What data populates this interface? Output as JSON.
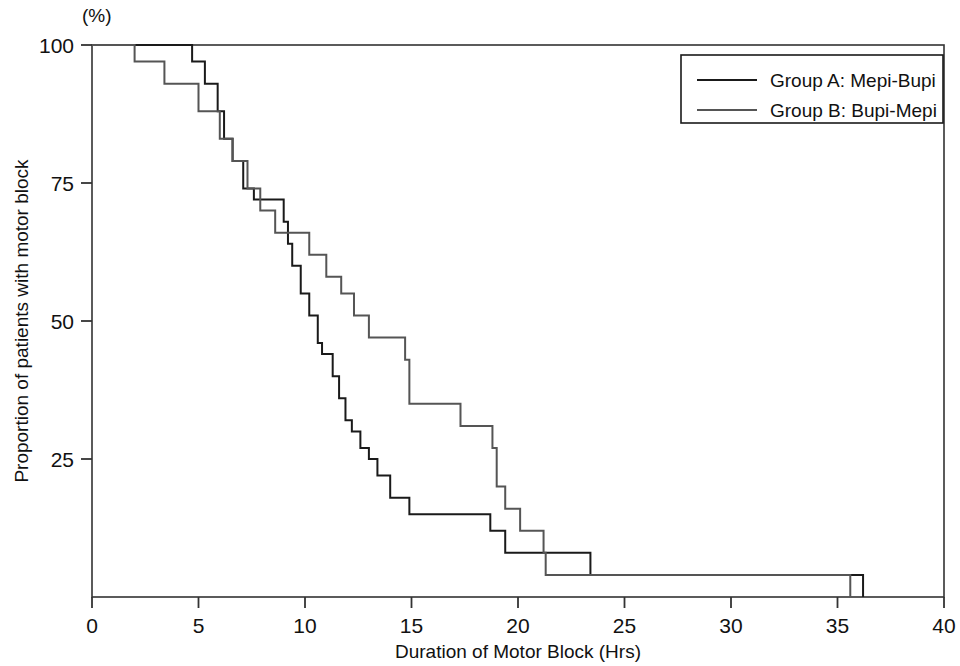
{
  "chart_data": {
    "type": "line",
    "subtype": "kaplan-meier-step",
    "title": "",
    "xlabel": "Duration of Motor Block (Hrs)",
    "ylabel": "Proportion of patients with motor block",
    "y_unit_label": "(%)",
    "xlim": [
      0,
      40
    ],
    "ylim": [
      0,
      100
    ],
    "xticks": [
      0,
      5,
      10,
      15,
      20,
      25,
      30,
      35,
      40
    ],
    "xtick_labels": [
      "0",
      "5",
      "10",
      "15",
      "20",
      "25",
      "30",
      "35",
      "40"
    ],
    "yticks": [
      25,
      50,
      75,
      100
    ],
    "ytick_labels": [
      "25",
      "50",
      "75",
      "100"
    ],
    "grid": false,
    "legend_position": "top-right",
    "legend_border": true,
    "series": [
      {
        "name": "Group A: Mepi-Bupi",
        "color": "#1a1a1a",
        "line_width": 2.0,
        "points": [
          [
            0.0,
            100
          ],
          [
            4.7,
            100
          ],
          [
            4.7,
            97
          ],
          [
            5.3,
            97
          ],
          [
            5.3,
            93
          ],
          [
            5.9,
            93
          ],
          [
            5.9,
            88
          ],
          [
            6.2,
            88
          ],
          [
            6.2,
            83
          ],
          [
            6.6,
            83
          ],
          [
            6.6,
            79
          ],
          [
            7.1,
            79
          ],
          [
            7.1,
            74
          ],
          [
            7.6,
            74
          ],
          [
            7.6,
            72
          ],
          [
            9.0,
            72
          ],
          [
            9.0,
            68
          ],
          [
            9.2,
            68
          ],
          [
            9.2,
            64
          ],
          [
            9.4,
            64
          ],
          [
            9.4,
            60
          ],
          [
            9.8,
            60
          ],
          [
            9.8,
            55
          ],
          [
            10.2,
            55
          ],
          [
            10.2,
            51
          ],
          [
            10.6,
            51
          ],
          [
            10.6,
            46
          ],
          [
            10.8,
            46
          ],
          [
            10.8,
            44
          ],
          [
            11.3,
            44
          ],
          [
            11.3,
            40
          ],
          [
            11.6,
            40
          ],
          [
            11.6,
            36
          ],
          [
            11.9,
            36
          ],
          [
            11.9,
            32
          ],
          [
            12.2,
            32
          ],
          [
            12.2,
            30
          ],
          [
            12.6,
            30
          ],
          [
            12.6,
            27
          ],
          [
            13.0,
            27
          ],
          [
            13.0,
            25
          ],
          [
            13.4,
            25
          ],
          [
            13.4,
            22
          ],
          [
            14.0,
            22
          ],
          [
            14.0,
            18
          ],
          [
            14.9,
            18
          ],
          [
            14.9,
            15
          ],
          [
            18.7,
            15
          ],
          [
            18.7,
            12
          ],
          [
            19.4,
            12
          ],
          [
            19.4,
            8
          ],
          [
            23.4,
            8
          ],
          [
            23.4,
            4
          ],
          [
            36.2,
            4
          ],
          [
            36.2,
            0
          ]
        ]
      },
      {
        "name": "Group B: Bupi-Mepi",
        "color": "#555555",
        "line_width": 2.0,
        "points": [
          [
            0.0,
            100
          ],
          [
            2.0,
            100
          ],
          [
            2.0,
            97
          ],
          [
            3.4,
            97
          ],
          [
            3.4,
            93
          ],
          [
            5.0,
            93
          ],
          [
            5.0,
            88
          ],
          [
            6.0,
            88
          ],
          [
            6.0,
            83
          ],
          [
            6.6,
            83
          ],
          [
            6.6,
            79
          ],
          [
            7.3,
            79
          ],
          [
            7.3,
            74
          ],
          [
            7.9,
            74
          ],
          [
            7.9,
            70
          ],
          [
            8.6,
            70
          ],
          [
            8.6,
            66
          ],
          [
            10.2,
            66
          ],
          [
            10.2,
            62
          ],
          [
            11.0,
            62
          ],
          [
            11.0,
            58
          ],
          [
            11.7,
            58
          ],
          [
            11.7,
            55
          ],
          [
            12.3,
            55
          ],
          [
            12.3,
            51
          ],
          [
            13.0,
            51
          ],
          [
            13.0,
            47
          ],
          [
            14.7,
            47
          ],
          [
            14.7,
            43
          ],
          [
            14.9,
            43
          ],
          [
            14.9,
            35
          ],
          [
            17.3,
            35
          ],
          [
            17.3,
            31
          ],
          [
            18.8,
            31
          ],
          [
            18.8,
            27
          ],
          [
            19.0,
            27
          ],
          [
            19.0,
            20
          ],
          [
            19.4,
            20
          ],
          [
            19.4,
            16
          ],
          [
            20.1,
            16
          ],
          [
            20.1,
            12
          ],
          [
            21.2,
            12
          ],
          [
            21.2,
            8
          ],
          [
            21.3,
            8
          ],
          [
            21.3,
            4
          ],
          [
            35.6,
            4
          ],
          [
            35.6,
            0
          ]
        ]
      }
    ]
  },
  "legend": {
    "entries": [
      {
        "label": "Group A: Mepi-Bupi",
        "color": "#1a1a1a"
      },
      {
        "label": "Group B: Bupi-Mepi",
        "color": "#555555"
      }
    ]
  },
  "axes": {
    "x_title": "Duration of Motor Block (Hrs)",
    "y_title": "Proportion of patients with motor block",
    "y_unit": "(%)",
    "xtick_0": "0",
    "xtick_1": "5",
    "xtick_2": "10",
    "xtick_3": "15",
    "xtick_4": "20",
    "xtick_5": "25",
    "xtick_6": "30",
    "xtick_7": "35",
    "xtick_8": "40",
    "ytick_0": "25",
    "ytick_1": "50",
    "ytick_2": "75",
    "ytick_3": "100"
  },
  "colors": {
    "group_a": "#1a1a1a",
    "group_b": "#555555",
    "axis": "#333333",
    "background": "#ffffff"
  }
}
